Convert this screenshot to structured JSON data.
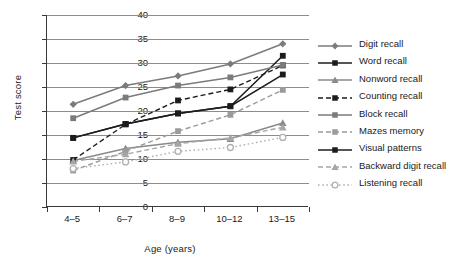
{
  "chart_data": {
    "type": "line",
    "title": "",
    "xlabel": "Age (years)",
    "ylabel": "Test score",
    "categories": [
      "4–5",
      "6–7",
      "8–9",
      "10–12",
      "13–15"
    ],
    "ylim": [
      0,
      40
    ],
    "yticks": [
      0,
      5,
      10,
      15,
      20,
      25,
      30,
      35,
      40
    ],
    "ytick_labels": [
      "0",
      "5",
      "10",
      "15",
      "20",
      "25",
      "30",
      "35",
      "40"
    ],
    "grid": "horizontal",
    "legend_position": "right",
    "series": [
      {
        "name": "Digit recall",
        "values": [
          21.4,
          25.3,
          27.3,
          29.8,
          34.0
        ],
        "color": "#7b7b7b",
        "marker": "diamond",
        "dash": "solid"
      },
      {
        "name": "Word recall",
        "values": [
          14.4,
          17.3,
          19.5,
          21.0,
          31.5
        ],
        "color": "#1c1c1c",
        "marker": "square",
        "dash": "solid"
      },
      {
        "name": "Nonword recall",
        "values": [
          9.7,
          12.2,
          13.5,
          14.2,
          17.5
        ],
        "color": "#8a8a8a",
        "marker": "triangle",
        "dash": "solid"
      },
      {
        "name": "Counting recall",
        "values": [
          9.8,
          17.2,
          22.2,
          24.5,
          29.5
        ],
        "color": "#1c1c1c",
        "marker": "square",
        "dash": "dashed"
      },
      {
        "name": "Block recall",
        "values": [
          18.5,
          22.8,
          25.3,
          27.0,
          29.6
        ],
        "color": "#7b7b7b",
        "marker": "square",
        "dash": "solid"
      },
      {
        "name": "Mazes memory",
        "values": [
          7.6,
          11.6,
          15.8,
          19.2,
          24.4
        ],
        "color": "#9b9b9b",
        "marker": "square",
        "dash": "dashed"
      },
      {
        "name": "Visual patterns",
        "values": [
          14.4,
          17.3,
          19.5,
          21.0,
          27.6
        ],
        "color": "#1c1c1c",
        "marker": "square",
        "dash": "solid"
      },
      {
        "name": "Backward digit recall",
        "values": [
          9.5,
          11.0,
          13.2,
          14.4,
          16.6
        ],
        "color": "#a6a6a6",
        "marker": "triangle",
        "dash": "dashed"
      },
      {
        "name": "Listening recall",
        "values": [
          8.0,
          9.4,
          11.6,
          12.4,
          14.5
        ],
        "color": "#b0b0b0",
        "marker": "circle-open",
        "dash": "dotted"
      }
    ]
  },
  "legend": {
    "items": [
      "Digit recall",
      "Word recall",
      "Nonword recall",
      "Counting recall",
      "Block recall",
      "Mazes memory",
      "Visual patterns",
      "Backward digit recall",
      "Listening recall"
    ]
  },
  "colors": {
    "axis": "#3a3a3a",
    "grid": "#8c8c8c",
    "text": "#1a1a1a",
    "background": "#ffffff"
  }
}
